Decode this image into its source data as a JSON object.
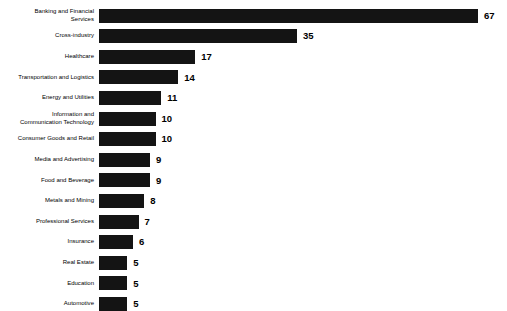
{
  "chart_data": {
    "type": "bar",
    "orientation": "horizontal",
    "title": "",
    "subtitle": "",
    "xlabel": "",
    "ylabel": "",
    "grid": false,
    "legend": false,
    "axis_visible": false,
    "value_labels": true,
    "xlim": [
      0,
      67
    ],
    "bar_color": "#141414",
    "background_color": "#ffffff",
    "categories": [
      "Banking and Financial\nServices",
      "Cross-industry",
      "Healthcare",
      "Transportation and Logistics",
      "Energy and Utilities",
      "Information and\nCommunication Technology",
      "Consumer Goods and Retail",
      "Media and Advertising",
      "Food and Beverage",
      "Metals and Mining",
      "Professional Services",
      "Insurance",
      "Real Estate",
      "Education",
      "Automotive"
    ],
    "values": [
      67,
      35,
      17,
      14,
      11,
      10,
      10,
      9,
      9,
      8,
      7,
      6,
      5,
      5,
      5
    ],
    "value_text": [
      "67",
      "35",
      "17",
      "14",
      "11",
      "10",
      "10",
      "9",
      "9",
      "8",
      "7",
      "6",
      "5",
      "5",
      "5"
    ]
  }
}
